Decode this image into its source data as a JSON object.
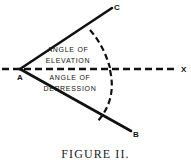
{
  "figure": {
    "caption": "FIGURE II.",
    "background_color": "#ffffff",
    "ink_color": "#111111"
  },
  "labels": {
    "vertex_a": "A",
    "point_c": "C",
    "point_b": "B",
    "axis_x": "X"
  },
  "annotations": {
    "elevation_line1": "ANGLE OF",
    "elevation_line2": "ELEVATION",
    "depression_line1": "ANGLE OF",
    "depression_line2": "DEPRESSION"
  },
  "geometry": {
    "vertex": {
      "x": 20,
      "y": 69
    },
    "ray_ac_end": {
      "x": 112,
      "y": 8
    },
    "ray_ab_end": {
      "x": 131,
      "y": 131
    },
    "axis_start": {
      "x": 2,
      "y": 69
    },
    "axis_end": {
      "x": 178,
      "y": 69
    },
    "arc_elevation": "M 90 30 Q 104 46 110 68",
    "arc_depression": "M 110 70 Q 117 100 97 122"
  }
}
